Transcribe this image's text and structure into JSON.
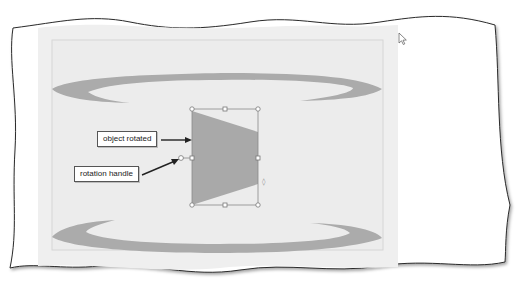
{
  "figure": {
    "colors": {
      "paper": "#ffffff",
      "slide_pane": "#efefef",
      "slide": "#eeeeee",
      "slide_border": "#d8d8d8",
      "shape_fill": "#a9a9a9",
      "swoosh_fill": "#ababab",
      "selection_frame": "#8a8a8a",
      "handle_fill": "#ffffff",
      "callout_border": "#555555"
    }
  },
  "callouts": [
    {
      "id": "object-rotated",
      "label": "object rotated"
    },
    {
      "id": "rotation-handle",
      "label": "rotation handle"
    }
  ],
  "shape": {
    "type": "trapezoid",
    "state": "selected",
    "handles": 8,
    "rotation_handle_side": "left"
  },
  "cursor": {
    "icon": "arrow-pointer-icon"
  }
}
